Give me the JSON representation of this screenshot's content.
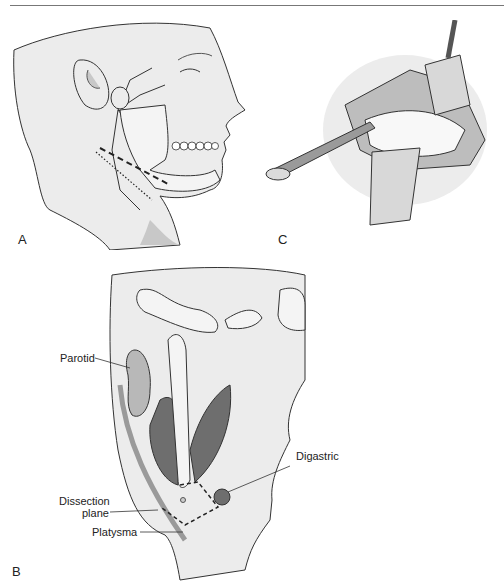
{
  "figure": {
    "panels": [
      {
        "id": "A",
        "label": "A",
        "description": "Lateral view of face showing facial nerve branches, mandible, and dashed/dotted incision lines below the jaw"
      },
      {
        "id": "B",
        "label": "B",
        "description": "Coronal cross-section showing parotid, masseter/pterygoid muscles, mandible ramus, digastric and platysma with dissection plane"
      },
      {
        "id": "C",
        "label": "C",
        "description": "Surgical field with retractors and instrument elevating tissue"
      }
    ],
    "annotations": {
      "parotid": "Parotid",
      "digastric": "Digastric",
      "dissection_line1": "Dissection",
      "dissection_line2": "plane",
      "platysma": "Platysma"
    },
    "colors": {
      "skin": "#ececec",
      "shadow": "#c8c8c8",
      "line": "#333333",
      "muscle": "#6e6e6e",
      "bone": "#f2f2f2",
      "gland": "#b8b8b8"
    }
  }
}
